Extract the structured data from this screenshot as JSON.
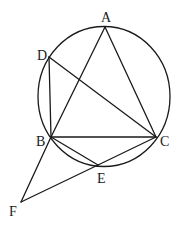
{
  "diagram": {
    "type": "geometry",
    "colors": {
      "stroke": "#1a1a1a",
      "background": "#ffffff"
    },
    "circle": {
      "cx": 104,
      "cy": 96.5,
      "rx": 66,
      "ry": 70
    },
    "points": [
      {
        "id": "A",
        "label": "A",
        "x": 105,
        "y": 27,
        "lx": 101,
        "ly": 22
      },
      {
        "id": "D",
        "label": "D",
        "x": 49,
        "y": 57,
        "lx": 37,
        "ly": 60
      },
      {
        "id": "B",
        "label": "B",
        "x": 51,
        "y": 137,
        "lx": 36,
        "ly": 146
      },
      {
        "id": "C",
        "label": "C",
        "x": 156,
        "y": 137,
        "lx": 160,
        "ly": 146
      },
      {
        "id": "E",
        "label": "E",
        "x": 98,
        "y": 165,
        "lx": 97,
        "ly": 183
      },
      {
        "id": "F",
        "label": "F",
        "x": 21,
        "y": 202,
        "lx": 9,
        "ly": 216
      }
    ],
    "segments": [
      [
        "A",
        "B"
      ],
      [
        "A",
        "C"
      ],
      [
        "B",
        "C"
      ],
      [
        "D",
        "B"
      ],
      [
        "D",
        "C"
      ],
      [
        "B",
        "E"
      ],
      [
        "C",
        "E"
      ],
      [
        "B",
        "F"
      ],
      [
        "F",
        "E"
      ]
    ]
  }
}
